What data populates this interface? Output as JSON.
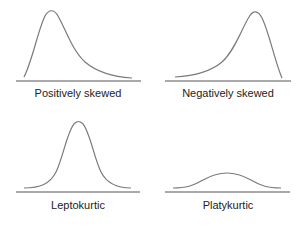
{
  "diagram": {
    "panels": [
      {
        "id": "positively-skewed",
        "label": "Positively skewed"
      },
      {
        "id": "negatively-skewed",
        "label": "Negatively skewed"
      },
      {
        "id": "leptokurtic",
        "label": "Leptokurtic"
      },
      {
        "id": "platykurtic",
        "label": "Platykurtic"
      }
    ],
    "colors": {
      "curve": "#7a7a7a",
      "axis": "#555555",
      "text": "#222222",
      "background": "#ffffff"
    }
  }
}
